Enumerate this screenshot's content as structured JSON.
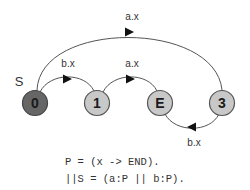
{
  "diagram": {
    "start_label": "S",
    "nodes": [
      {
        "id": "0",
        "label": "0",
        "fill": "#666666",
        "initial": true
      },
      {
        "id": "1",
        "label": "1",
        "fill": "#c8c8c8"
      },
      {
        "id": "E",
        "label": "E",
        "fill": "#c8c8c8"
      },
      {
        "id": "3",
        "label": "3",
        "fill": "#c8c8c8"
      }
    ],
    "edges": [
      {
        "from": "0",
        "to": "3",
        "label": "a.x"
      },
      {
        "from": "0",
        "to": "1",
        "label": "b.x"
      },
      {
        "from": "1",
        "to": "E",
        "label": "a.x"
      },
      {
        "from": "3",
        "to": "E",
        "label": "b.x"
      }
    ],
    "colors": {
      "initial_node": "#666666",
      "node": "#c8c8c8",
      "stroke": "#555555"
    }
  },
  "code": {
    "line1": "P = (x -> END).",
    "line2": "||S = (a:P || b:P)."
  }
}
